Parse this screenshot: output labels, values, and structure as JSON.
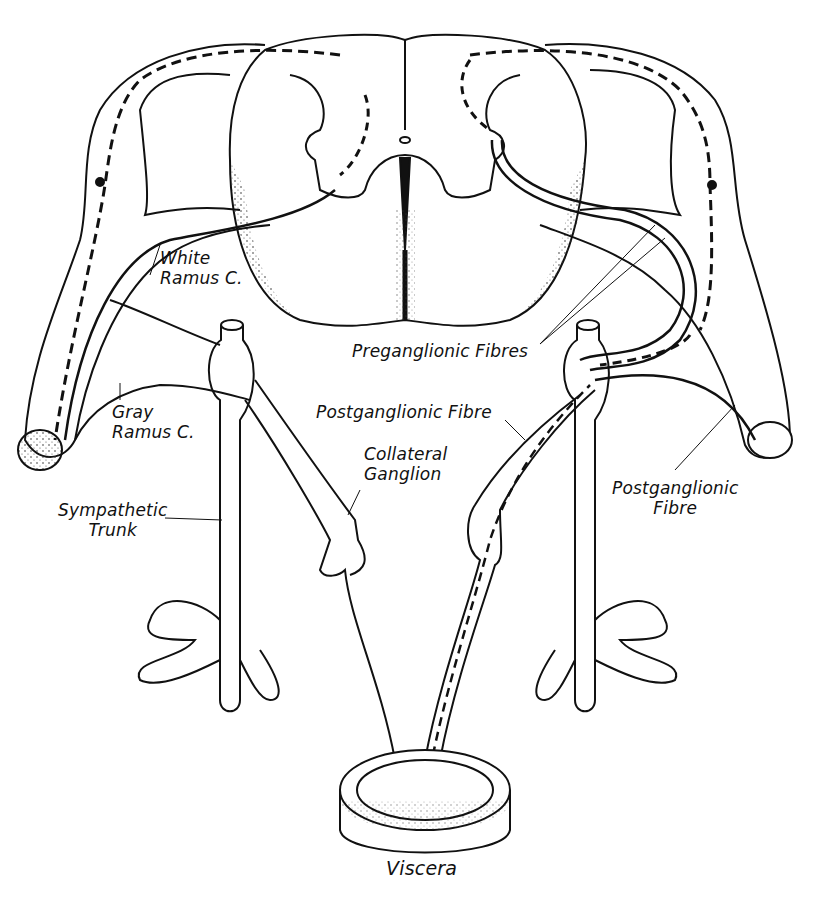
{
  "figure": {
    "colors": {
      "ink": "#111111",
      "background": "#ffffff",
      "stipple": "#333333"
    }
  },
  "labels": {
    "white_ramus": [
      "White",
      "Ramus C."
    ],
    "gray_ramus": [
      "Gray",
      "Ramus C."
    ],
    "sympathetic_trunk": [
      "Sympathetic",
      "Trunk"
    ],
    "preganglionic": "Preganglionic Fibres",
    "postganglionic_center": "Postganglionic Fibre",
    "collateral_ganglion": [
      "Collateral",
      "Ganglion"
    ],
    "postganglionic_right": [
      "Postganglionic",
      "Fibre"
    ],
    "viscera": "Viscera"
  }
}
